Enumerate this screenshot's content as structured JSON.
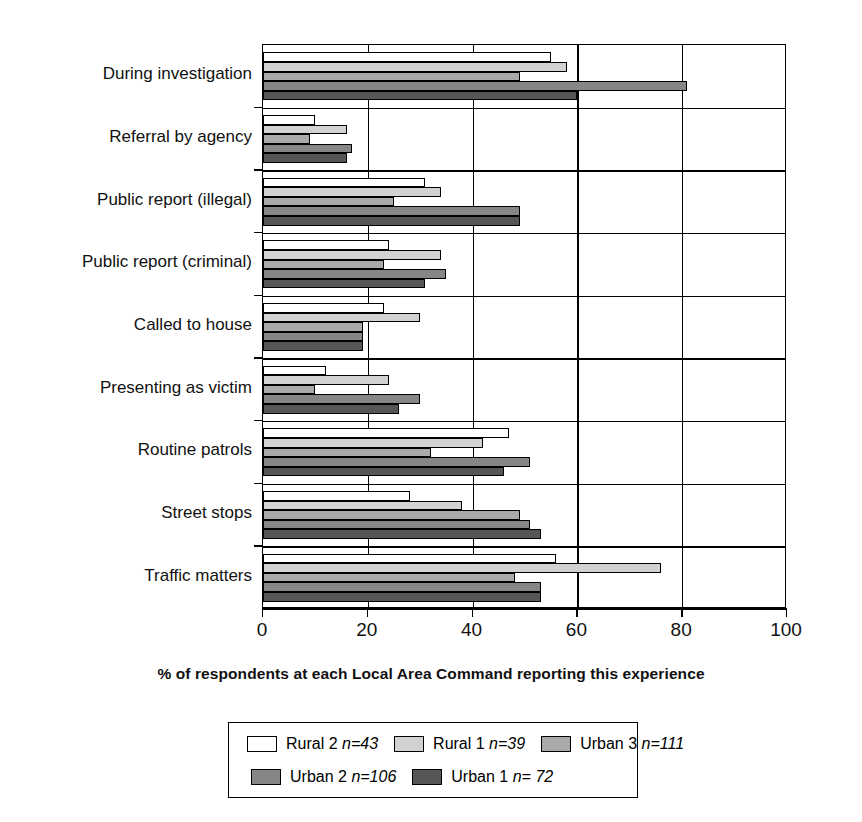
{
  "chart_data": {
    "type": "bar",
    "orientation": "horizontal",
    "title": "",
    "xlabel": "% of respondents at each Local Area Command reporting this experience",
    "ylabel": "",
    "xlim": [
      0,
      100
    ],
    "xticks": [
      0,
      20,
      40,
      60,
      80,
      100
    ],
    "grid": true,
    "legend_position": "bottom",
    "categories": [
      "During investigation",
      "Referral by agency",
      "Public report (illegal)",
      "Public report (criminal)",
      "Called to house",
      "Presenting as victim",
      "Routine patrols",
      "Street stops",
      "Traffic matters"
    ],
    "series": [
      {
        "name": "Rural 2",
        "n": 43,
        "label": "Rural 2 n=43",
        "color": "#ffffff",
        "values": [
          55,
          10,
          31,
          24,
          23,
          12,
          47,
          28,
          56
        ]
      },
      {
        "name": "Rural 1",
        "n": 39,
        "label": "Rural 1 n=39",
        "color": "#d2d2d2",
        "values": [
          58,
          16,
          34,
          34,
          30,
          24,
          42,
          38,
          76
        ]
      },
      {
        "name": "Urban 3",
        "n": 111,
        "label": "Urban 3 n=111",
        "color": "#aaaaaa",
        "values": [
          49,
          9,
          25,
          23,
          19,
          10,
          32,
          49,
          48
        ]
      },
      {
        "name": "Urban 2",
        "n": 106,
        "label": "Urban 2 n=106",
        "color": "#868686",
        "values": [
          81,
          17,
          49,
          35,
          19,
          30,
          51,
          51,
          53
        ]
      },
      {
        "name": "Urban 1",
        "n": 72,
        "label": "Urban 1 n= 72",
        "color": "#565656",
        "values": [
          60,
          16,
          49,
          31,
          19,
          26,
          46,
          53,
          53
        ]
      }
    ]
  },
  "axis": {
    "tick_labels": [
      "0",
      "20",
      "40",
      "60",
      "80",
      "100"
    ],
    "title": "% of respondents at each Local Area Command reporting this experience"
  },
  "legend": {
    "entries": [
      {
        "name": "Rural 2",
        "n_text": "n=43",
        "prefix": "Rural 2 "
      },
      {
        "name": "Rural 1",
        "n_text": "n=39",
        "prefix": "Rural 1 "
      },
      {
        "name": "Urban 3",
        "n_text": "n=111",
        "prefix": "Urban 3 "
      },
      {
        "name": "Urban 2",
        "n_text": "n=106",
        "prefix": "Urban 2 "
      },
      {
        "name": "Urban 1",
        "n_text": "n= 72",
        "prefix": "Urban 1 "
      }
    ]
  }
}
